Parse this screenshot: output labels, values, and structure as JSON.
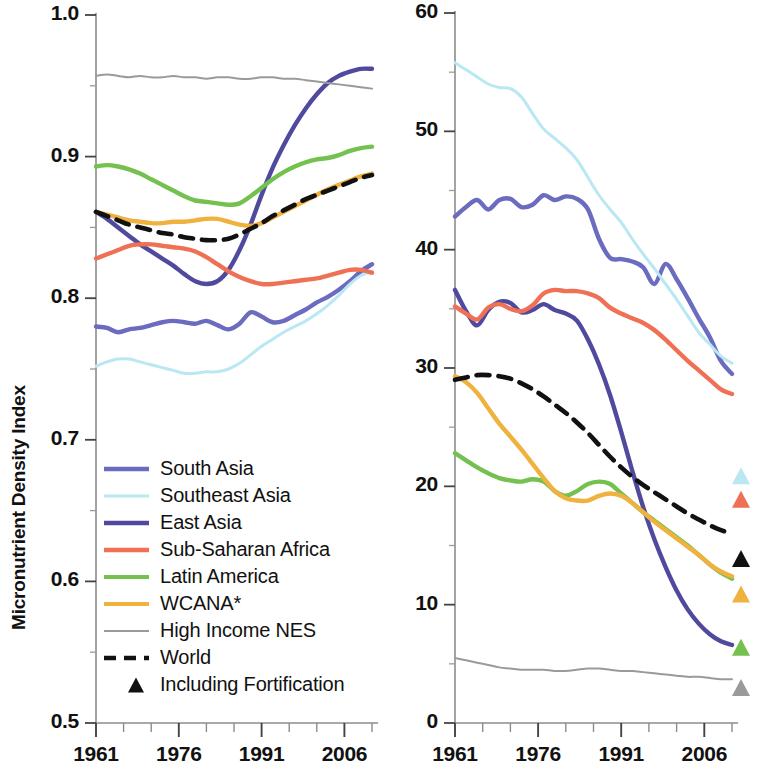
{
  "figure": {
    "panels": [
      {
        "id": "left",
        "ylabel": "Micronutrient Density Index",
        "yticks": [
          "0.5",
          "0.6",
          "0.7",
          "0.8",
          "0.9",
          "1.0"
        ],
        "xticks": [
          "1961",
          "1976",
          "1991",
          "2006"
        ]
      },
      {
        "id": "right",
        "ylabel": "Prevalence of Inadequate Micronutrient Intake Index (%)",
        "yticks": [
          "0",
          "10",
          "20",
          "30",
          "40",
          "50",
          "60"
        ],
        "xticks": [
          "1961",
          "1976",
          "1991",
          "2006"
        ]
      }
    ]
  },
  "legend": {
    "items": [
      {
        "label": "South Asia",
        "color": "#6b6bbf",
        "style": "solid",
        "width": 4.5,
        "marker": "line"
      },
      {
        "label": "Southeast Asia",
        "color": "#b9e7f2",
        "style": "solid",
        "width": 3.0,
        "marker": "line"
      },
      {
        "label": "East Asia",
        "color": "#4f4a9e",
        "style": "solid",
        "width": 4.5,
        "marker": "line"
      },
      {
        "label": "Sub-Saharan Africa",
        "color": "#ef7055",
        "style": "solid",
        "width": 4.5,
        "marker": "line"
      },
      {
        "label": "Latin America",
        "color": "#74c14f",
        "style": "solid",
        "width": 4.0,
        "marker": "line"
      },
      {
        "label": "WCANA*",
        "color": "#f0b23f",
        "style": "solid",
        "width": 4.0,
        "marker": "line"
      },
      {
        "label": "High Income NES",
        "color": "#9a9a9a",
        "style": "solid",
        "width": 2.0,
        "marker": "line"
      },
      {
        "label": "World",
        "color": "#111111",
        "style": "dashed",
        "width": 4.5,
        "marker": "line"
      },
      {
        "label": "Including Fortification",
        "color": "#111111",
        "style": "none",
        "width": 0,
        "marker": "triangle"
      }
    ]
  },
  "chart_data": [
    {
      "type": "line",
      "id": "micronutrient-density-index",
      "title": "",
      "xlabel": "",
      "ylabel": "Micronutrient Density Index",
      "xlim": [
        1961,
        2011
      ],
      "ylim": [
        0.5,
        1.0
      ],
      "yticks": [
        0.5,
        0.6,
        0.7,
        0.8,
        0.9,
        1.0
      ],
      "xticks": [
        1961,
        1976,
        1991,
        2006
      ],
      "xtick_minor_step": 5,
      "grid": false,
      "legend_position": "lower-left-inside",
      "x": [
        1961,
        1963,
        1965,
        1967,
        1969,
        1971,
        1973,
        1975,
        1977,
        1979,
        1981,
        1983,
        1985,
        1987,
        1989,
        1991,
        1993,
        1995,
        1997,
        1999,
        2001,
        2003,
        2005,
        2007,
        2009,
        2011
      ],
      "series": [
        {
          "name": "South Asia",
          "color": "#6b6bbf",
          "values": [
            0.78,
            0.779,
            0.776,
            0.778,
            0.779,
            0.781,
            0.783,
            0.784,
            0.783,
            0.782,
            0.784,
            0.781,
            0.778,
            0.782,
            0.79,
            0.787,
            0.783,
            0.784,
            0.788,
            0.792,
            0.797,
            0.801,
            0.806,
            0.812,
            0.819,
            0.824
          ]
        },
        {
          "name": "Southeast Asia",
          "color": "#b9e7f2",
          "values": [
            0.752,
            0.755,
            0.757,
            0.757,
            0.755,
            0.753,
            0.751,
            0.749,
            0.747,
            0.747,
            0.748,
            0.748,
            0.75,
            0.754,
            0.76,
            0.766,
            0.771,
            0.776,
            0.78,
            0.784,
            0.789,
            0.795,
            0.802,
            0.81,
            0.816,
            0.819
          ]
        },
        {
          "name": "East Asia",
          "color": "#4f4a9e",
          "values": [
            0.861,
            0.856,
            0.85,
            0.844,
            0.838,
            0.833,
            0.828,
            0.823,
            0.817,
            0.812,
            0.81,
            0.812,
            0.82,
            0.834,
            0.852,
            0.873,
            0.892,
            0.908,
            0.922,
            0.934,
            0.944,
            0.952,
            0.957,
            0.96,
            0.962,
            0.962
          ]
        },
        {
          "name": "Sub-Saharan Africa",
          "color": "#ef7055",
          "values": [
            0.828,
            0.831,
            0.834,
            0.837,
            0.838,
            0.838,
            0.837,
            0.836,
            0.835,
            0.833,
            0.829,
            0.824,
            0.819,
            0.815,
            0.812,
            0.81,
            0.81,
            0.811,
            0.812,
            0.813,
            0.814,
            0.816,
            0.818,
            0.82,
            0.82,
            0.818
          ]
        },
        {
          "name": "Latin America",
          "color": "#74c14f",
          "values": [
            0.893,
            0.894,
            0.893,
            0.891,
            0.888,
            0.884,
            0.88,
            0.876,
            0.872,
            0.869,
            0.868,
            0.867,
            0.866,
            0.867,
            0.872,
            0.878,
            0.884,
            0.889,
            0.893,
            0.896,
            0.898,
            0.899,
            0.901,
            0.904,
            0.906,
            0.907
          ]
        },
        {
          "name": "WCANA*",
          "color": "#f0b23f",
          "values": [
            0.861,
            0.859,
            0.857,
            0.855,
            0.854,
            0.853,
            0.853,
            0.854,
            0.854,
            0.855,
            0.856,
            0.856,
            0.854,
            0.852,
            0.851,
            0.853,
            0.857,
            0.861,
            0.865,
            0.869,
            0.873,
            0.877,
            0.88,
            0.883,
            0.886,
            0.888
          ]
        },
        {
          "name": "High Income NES",
          "color": "#9a9a9a",
          "values": [
            0.957,
            0.958,
            0.957,
            0.956,
            0.957,
            0.956,
            0.956,
            0.957,
            0.956,
            0.956,
            0.955,
            0.956,
            0.956,
            0.955,
            0.955,
            0.956,
            0.956,
            0.955,
            0.955,
            0.954,
            0.953,
            0.952,
            0.951,
            0.95,
            0.949,
            0.948
          ]
        },
        {
          "name": "World",
          "color": "#111111",
          "style": "dashed",
          "values": [
            0.861,
            0.858,
            0.855,
            0.852,
            0.85,
            0.848,
            0.846,
            0.845,
            0.843,
            0.842,
            0.841,
            0.841,
            0.842,
            0.845,
            0.849,
            0.853,
            0.858,
            0.862,
            0.866,
            0.87,
            0.873,
            0.876,
            0.879,
            0.882,
            0.885,
            0.887
          ]
        }
      ]
    },
    {
      "type": "line",
      "id": "prevalence-inadequate-micronutrient-intake-index",
      "title": "",
      "xlabel": "",
      "ylabel": "Prevalence of Inadequate Micronutrient Intake Index (%)",
      "xlim": [
        1961,
        2011
      ],
      "ylim": [
        0,
        60
      ],
      "yticks": [
        0,
        10,
        20,
        30,
        40,
        50,
        60
      ],
      "xticks": [
        1961,
        1976,
        1991,
        2006
      ],
      "xtick_minor_step": 5,
      "grid": false,
      "legend_position": "shared-with-left-panel",
      "x": [
        1961,
        1963,
        1965,
        1967,
        1969,
        1971,
        1973,
        1975,
        1977,
        1979,
        1981,
        1983,
        1985,
        1987,
        1989,
        1991,
        1993,
        1995,
        1997,
        1999,
        2001,
        2003,
        2005,
        2007,
        2009,
        2011
      ],
      "series": [
        {
          "name": "South Asia",
          "color": "#6b6bbf",
          "values": [
            42.8,
            43.6,
            44.2,
            43.4,
            44.2,
            44.3,
            43.6,
            43.8,
            44.6,
            44.2,
            44.5,
            44.3,
            43.4,
            40.9,
            39.3,
            39.2,
            39.0,
            38.5,
            37.1,
            38.8,
            37.5,
            35.9,
            34.2,
            32.6,
            30.6,
            29.5
          ]
        },
        {
          "name": "Southeast Asia",
          "color": "#b9e7f2",
          "values": [
            55.8,
            55.2,
            54.6,
            54.0,
            53.7,
            53.6,
            52.9,
            51.5,
            50.2,
            49.4,
            48.6,
            47.6,
            46.1,
            44.6,
            43.4,
            42.3,
            40.9,
            39.6,
            38.4,
            37.1,
            35.8,
            34.4,
            33.0,
            32.0,
            31.0,
            30.4
          ]
        },
        {
          "name": "East Asia",
          "color": "#4f4a9e",
          "values": [
            36.6,
            34.8,
            33.6,
            34.9,
            35.6,
            35.5,
            34.7,
            34.9,
            35.4,
            34.9,
            34.6,
            34.0,
            32.4,
            30.3,
            27.7,
            24.6,
            21.3,
            18.2,
            15.5,
            13.2,
            11.2,
            9.6,
            8.4,
            7.5,
            6.9,
            6.6
          ]
        },
        {
          "name": "Sub-Saharan Africa",
          "color": "#ef7055",
          "values": [
            35.2,
            34.6,
            34.1,
            35.1,
            35.4,
            35.0,
            34.8,
            35.3,
            36.3,
            36.6,
            36.5,
            36.5,
            36.3,
            35.9,
            35.1,
            34.6,
            34.2,
            33.8,
            33.2,
            32.4,
            31.5,
            30.6,
            29.8,
            29.0,
            28.2,
            27.8
          ]
        },
        {
          "name": "Latin America",
          "color": "#74c14f",
          "values": [
            22.8,
            22.2,
            21.6,
            21.1,
            20.7,
            20.5,
            20.4,
            20.6,
            20.4,
            19.6,
            19.2,
            19.6,
            20.2,
            20.4,
            20.2,
            19.4,
            18.6,
            17.8,
            17.1,
            16.4,
            15.7,
            15.0,
            14.2,
            13.4,
            12.7,
            12.2
          ]
        },
        {
          "name": "WCANA*",
          "color": "#f0b23f",
          "values": [
            29.3,
            28.8,
            27.9,
            26.6,
            25.3,
            24.2,
            23.1,
            21.9,
            20.7,
            19.6,
            19.0,
            18.8,
            18.8,
            19.2,
            19.4,
            19.2,
            18.6,
            17.8,
            17.0,
            16.3,
            15.6,
            14.9,
            14.2,
            13.4,
            12.8,
            12.4
          ]
        },
        {
          "name": "High Income NES",
          "color": "#9a9a9a",
          "values": [
            5.5,
            5.3,
            5.1,
            4.9,
            4.7,
            4.6,
            4.5,
            4.5,
            4.5,
            4.4,
            4.4,
            4.5,
            4.6,
            4.6,
            4.5,
            4.4,
            4.4,
            4.3,
            4.2,
            4.1,
            4.0,
            3.9,
            3.9,
            3.8,
            3.7,
            3.7
          ]
        },
        {
          "name": "World",
          "color": "#111111",
          "style": "dashed",
          "values": [
            29.0,
            29.2,
            29.4,
            29.4,
            29.3,
            29.1,
            28.7,
            28.2,
            27.6,
            26.9,
            26.2,
            25.4,
            24.5,
            23.5,
            22.5,
            21.6,
            20.8,
            20.1,
            19.5,
            18.9,
            18.3,
            17.7,
            17.2,
            16.7,
            16.3,
            16.0
          ]
        }
      ],
      "fortification_markers": [
        {
          "name": "Southeast Asia",
          "color": "#b9e7f2",
          "x": 2011,
          "y": 20.9
        },
        {
          "name": "Sub-Saharan Africa",
          "color": "#ef7055",
          "x": 2011,
          "y": 18.9
        },
        {
          "name": "World",
          "color": "#111111",
          "x": 2011,
          "y": 13.9
        },
        {
          "name": "WCANA*",
          "color": "#f0b23f",
          "x": 2011,
          "y": 10.9
        },
        {
          "name": "Latin America",
          "color": "#74c14f",
          "x": 2011,
          "y": 6.4
        },
        {
          "name": "High Income NES",
          "color": "#9a9a9a",
          "x": 2011,
          "y": 3.0
        }
      ]
    }
  ]
}
